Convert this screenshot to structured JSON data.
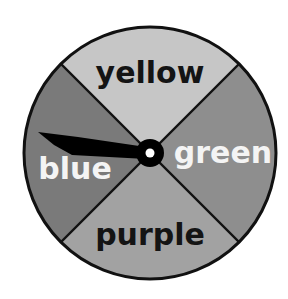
{
  "spinner": {
    "sections": [
      {
        "label": "yellow",
        "fill": "#c6c6c6",
        "text_color": "#141414"
      },
      {
        "label": "green",
        "fill": "#8e8e8e",
        "text_color": "#f4f4f4"
      },
      {
        "label": "purple",
        "fill": "#a2a2a2",
        "text_color": "#141414"
      },
      {
        "label": "blue",
        "fill": "#7a7a7a",
        "text_color": "#f4f4f4"
      }
    ],
    "outline_color": "#111111",
    "pointer_color": "#000000",
    "pointer_pointing_to": "blue"
  }
}
